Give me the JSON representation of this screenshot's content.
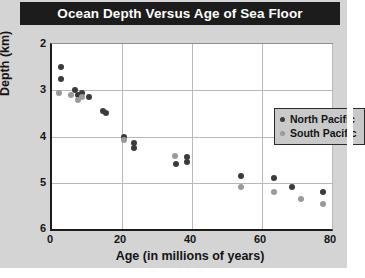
{
  "chart_data": {
    "type": "scatter",
    "title": "Ocean Depth Versus Age of Sea Floor",
    "xlabel": "Age (in millions of years)",
    "ylabel": "Depth (km)",
    "xlim": [
      0,
      80
    ],
    "ylim": [
      2,
      6
    ],
    "y_inverted": true,
    "grid": true,
    "legend_position": "top-right",
    "xticks": [
      0,
      20,
      40,
      60,
      80
    ],
    "yticks": [
      2,
      3,
      4,
      5,
      6
    ],
    "series": [
      {
        "name": "North Pacific",
        "color": "#3b3b3b",
        "points": [
          {
            "x": 2.5,
            "y": 2.5
          },
          {
            "x": 2.5,
            "y": 2.75
          },
          {
            "x": 6.5,
            "y": 3.0
          },
          {
            "x": 7.5,
            "y": 3.1
          },
          {
            "x": 8.5,
            "y": 3.05
          },
          {
            "x": 10.5,
            "y": 3.15
          },
          {
            "x": 14.5,
            "y": 3.45
          },
          {
            "x": 15.5,
            "y": 3.5
          },
          {
            "x": 20.5,
            "y": 4.0
          },
          {
            "x": 23.5,
            "y": 4.15
          },
          {
            "x": 23.5,
            "y": 4.25
          },
          {
            "x": 35.5,
            "y": 4.6
          },
          {
            "x": 38.5,
            "y": 4.55
          },
          {
            "x": 38.5,
            "y": 4.45
          },
          {
            "x": 54.0,
            "y": 4.85
          },
          {
            "x": 63.5,
            "y": 4.9
          },
          {
            "x": 68.5,
            "y": 5.1
          },
          {
            "x": 77.5,
            "y": 5.2
          }
        ]
      },
      {
        "name": "South Pacific",
        "color": "#9a9a9a",
        "points": [
          {
            "x": 2.0,
            "y": 3.05
          },
          {
            "x": 5.5,
            "y": 3.1
          },
          {
            "x": 7.5,
            "y": 3.2
          },
          {
            "x": 8.5,
            "y": 3.15
          },
          {
            "x": 20.5,
            "y": 4.07
          },
          {
            "x": 35.0,
            "y": 4.42
          },
          {
            "x": 54.0,
            "y": 5.1
          },
          {
            "x": 63.5,
            "y": 5.2
          },
          {
            "x": 71.0,
            "y": 5.35
          },
          {
            "x": 77.5,
            "y": 5.45
          }
        ]
      }
    ]
  },
  "legend": {
    "entries": [
      {
        "label": "North Pacific",
        "key": "north"
      },
      {
        "label": "South Pacific",
        "key": "south"
      }
    ]
  }
}
